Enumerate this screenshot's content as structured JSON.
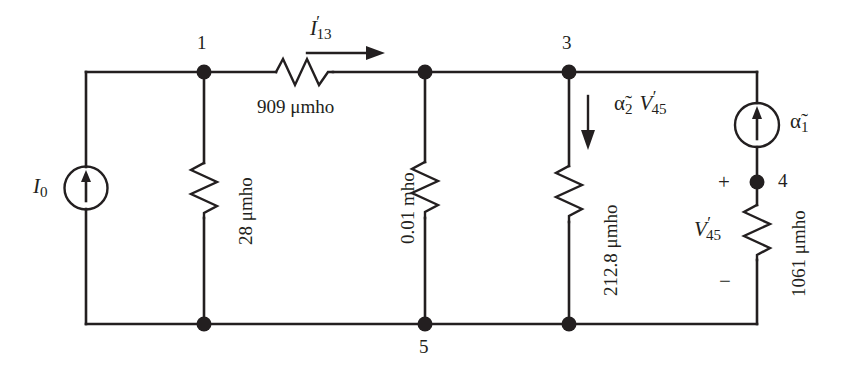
{
  "figure": {
    "kind": "electrical-circuit-schematic",
    "line_color": "#231f20",
    "background_color": "#ffffff"
  },
  "nodes": [
    {
      "id": "node-1",
      "label": "1",
      "x": 204,
      "y": 72
    },
    {
      "id": "node-2",
      "label": "",
      "x": 425,
      "y": 72
    },
    {
      "id": "node-3",
      "label": "3",
      "x": 569,
      "y": 72
    },
    {
      "id": "node-4",
      "label": "4",
      "x": 757,
      "y": 182
    },
    {
      "id": "node-5",
      "label": "5",
      "x": 425,
      "y": 324
    },
    {
      "id": "node-bot-1",
      "label": "",
      "x": 204,
      "y": 324
    },
    {
      "id": "node-bot-3",
      "label": "",
      "x": 569,
      "y": 324
    }
  ],
  "sources": [
    {
      "id": "source-i0",
      "label": "I",
      "sub": "0",
      "type": "current-source",
      "direction": "up",
      "cx": 86,
      "cy": 188
    },
    {
      "id": "source-alpha1",
      "label": "α̃",
      "sub": "1",
      "type": "dependent-current-source",
      "direction": "up",
      "cx": 757,
      "cy": 125
    }
  ],
  "resistors": [
    {
      "id": "r-909",
      "value": "909 μmho",
      "orientation": "horizontal"
    },
    {
      "id": "r-28",
      "value": "28 μmho",
      "orientation": "vertical"
    },
    {
      "id": "r-001",
      "value": "0.01 mho",
      "orientation": "vertical"
    },
    {
      "id": "r-2128",
      "value": "212.8 μmho",
      "orientation": "vertical"
    },
    {
      "id": "r-1061",
      "value": "1061 μmho",
      "orientation": "vertical"
    }
  ],
  "annotations": {
    "current_i13": {
      "symbol": "I",
      "sub": "13",
      "prime": "′",
      "arrow": "right"
    },
    "dependent_source_2": {
      "coefficient": "α̃",
      "coefficient_sub": "2",
      "variable": "V",
      "variable_sub": "45",
      "prime": "′",
      "arrow": "down"
    },
    "voltage_v45": {
      "symbol": "V",
      "sub": "45",
      "prime": "′",
      "plus": "+",
      "minus": "−"
    }
  },
  "labels": {
    "node1": "1",
    "node3": "3",
    "node4": "4",
    "node5": "5",
    "i0_symbol": "I",
    "i0_sub": "0",
    "alpha1_symbol": "α̃",
    "alpha1_sub": "1",
    "alpha2_symbol": "α̃",
    "alpha2_sub": "2",
    "v45_symbol": "V",
    "v45_sub": "45",
    "i13_symbol": "I",
    "i13_sub": "13",
    "prime_mark": "′",
    "r909": "909 μmho",
    "r28": "28 μmho",
    "r001": "0.01 mho",
    "r2128": "212.8 μmho",
    "r1061": "1061 μmho",
    "plus_sign": "+",
    "minus_sign": "−"
  }
}
